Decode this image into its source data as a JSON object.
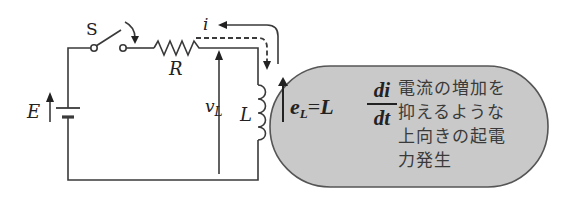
{
  "diagram": {
    "type": "RL circuit with switch",
    "components": {
      "switch": {
        "label": "S"
      },
      "resistor": {
        "label": "R"
      },
      "inductor": {
        "label": "L"
      },
      "battery": {
        "label": "E"
      },
      "current": {
        "label": "i"
      },
      "inductor_voltage": {
        "label": "v",
        "subscript": "L"
      }
    },
    "callout": {
      "formula": {
        "lhs_symbol": "e",
        "lhs_subscript": "L",
        "equals": "=",
        "coefficient": "L",
        "numerator": "di",
        "denominator": "dt"
      },
      "text_lines": [
        "電流の増加を",
        "抑えるような",
        "上向きの起電",
        "力発生"
      ],
      "fill_color": "#c9c9c9",
      "border_color": "#555555"
    },
    "colors": {
      "wire": "#3a3a3a",
      "text": "#222222"
    }
  }
}
